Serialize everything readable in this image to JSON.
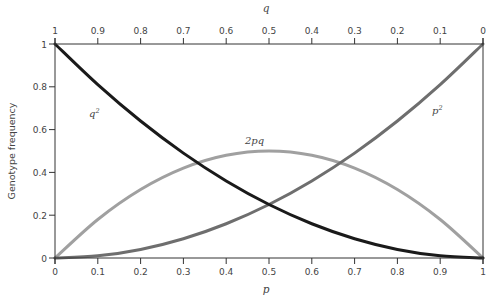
{
  "chart_data": {
    "type": "line",
    "title": "",
    "xlabel": "p",
    "x2label": "q",
    "ylabel": "Genotype frequency",
    "xlim": [
      0,
      1
    ],
    "ylim": [
      0,
      1
    ],
    "grid": false,
    "legend": "inline labels",
    "x_ticks": [
      "0",
      "0.1",
      "0.2",
      "0.3",
      "0.4",
      "0.5",
      "0.6",
      "0.7",
      "0.8",
      "0.9",
      "1"
    ],
    "x2_ticks": [
      "1",
      "0.9",
      "0.8",
      "0.7",
      "0.6",
      "0.5",
      "0.4",
      "0.3",
      "0.2",
      "0.1",
      "0"
    ],
    "y_ticks": [
      "0",
      "0.2",
      "0.4",
      "0.6",
      "0.8",
      "1"
    ],
    "x": [
      0,
      0.1,
      0.2,
      0.3,
      0.4,
      0.5,
      0.6,
      0.7,
      0.8,
      0.9,
      1
    ],
    "series": [
      {
        "name": "q²",
        "label_text": "q",
        "label_sup": "2",
        "color": "#1a1a1a",
        "values": [
          1,
          0.81,
          0.64,
          0.49,
          0.36,
          0.25,
          0.16,
          0.09,
          0.04,
          0.01,
          0
        ]
      },
      {
        "name": "2pq",
        "label_text": "2pq",
        "label_sup": "",
        "color": "#a0a0a0",
        "values": [
          0,
          0.18,
          0.32,
          0.42,
          0.48,
          0.5,
          0.48,
          0.42,
          0.32,
          0.18,
          0
        ]
      },
      {
        "name": "p²",
        "label_text": "p",
        "label_sup": "2",
        "color": "#6e6e6e",
        "values": [
          0,
          0.01,
          0.04,
          0.09,
          0.16,
          0.25,
          0.36,
          0.49,
          0.64,
          0.81,
          1
        ]
      }
    ]
  }
}
